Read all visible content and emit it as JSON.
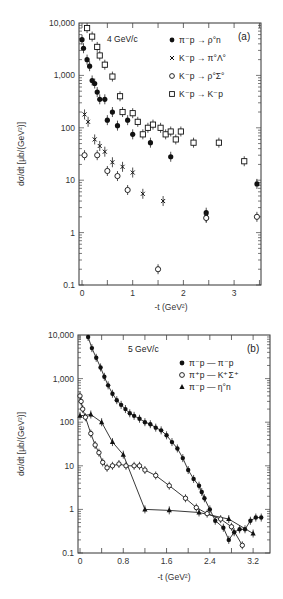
{
  "chart_data": [
    {
      "panel": "(a)",
      "type": "scatter",
      "title": "4 GeV/c",
      "xlabel": "-t (GeV²)",
      "ylabel": "dσ/dt [μb/(GeV²)]",
      "yscale": "log",
      "ylim": [
        0.1,
        10000
      ],
      "xlim": [
        0,
        3.5
      ],
      "xticks": [
        "0",
        "1",
        "2",
        "3"
      ],
      "yticks": [
        "10,000",
        "1,000",
        "100",
        "10",
        "1",
        "0.1"
      ],
      "legend_position": "upper right",
      "series": [
        {
          "name": "π⁻p → ρ°n",
          "marker": "filled-circle",
          "x": [
            0.0,
            0.03,
            0.1,
            0.15,
            0.2,
            0.25,
            0.3,
            0.35,
            0.45,
            0.5,
            0.6,
            0.7,
            0.9,
            1.0,
            1.35,
            1.75,
            2.45,
            3.45
          ],
          "y": [
            4800,
            3300,
            2000,
            1500,
            800,
            700,
            480,
            350,
            350,
            140,
            200,
            110,
            140,
            75,
            52,
            28,
            2.4,
            8.5
          ]
        },
        {
          "name": "K⁻p → π°Λ°",
          "marker": "cross",
          "x": [
            0.05,
            0.12,
            0.25,
            0.35,
            0.45,
            0.6,
            0.8,
            1.0,
            1.2,
            1.6,
            2.45
          ],
          "y": [
            180,
            130,
            60,
            45,
            35,
            22,
            18,
            14,
            5.5,
            4,
            2
          ]
        },
        {
          "name": "K⁻p → ρ°Σ°",
          "marker": "open-circle",
          "x": [
            0.05,
            0.3,
            0.5,
            0.7,
            0.9,
            1.5,
            2.45,
            3.45
          ],
          "y": [
            30,
            30,
            15,
            12,
            6.5,
            0.2,
            1.9,
            2
          ]
        },
        {
          "name": "K⁻p → K⁻p",
          "marker": "open-square",
          "x": [
            0.1,
            0.2,
            0.3,
            0.35,
            0.45,
            0.6,
            0.75,
            0.8,
            1.0,
            1.1,
            1.2,
            1.3,
            1.4,
            1.55,
            1.65,
            1.75,
            1.85,
            1.95,
            2.2,
            2.7,
            3.2
          ],
          "y": [
            8000,
            5500,
            3500,
            2400,
            1600,
            950,
            400,
            200,
            190,
            130,
            75,
            100,
            115,
            100,
            75,
            85,
            60,
            85,
            52,
            52,
            23,
            6.5,
            3.2
          ]
        }
      ]
    },
    {
      "panel": "(b)",
      "type": "scatter",
      "title": "5 GeV/c",
      "xlabel": "-t (GeV²)",
      "ylabel": "dσ/dt [μb/(GeV²)]",
      "yscale": "log",
      "ylim": [
        0.1,
        10000
      ],
      "xlim": [
        0,
        3.55
      ],
      "xticks": [
        "0",
        "0.8",
        "1.6",
        "2.4",
        "3.2"
      ],
      "yticks": [
        "10,000",
        "1,000",
        "100",
        "10",
        "1",
        "0.1"
      ],
      "legend_position": "upper right",
      "series": [
        {
          "name": "π⁻p → π⁻p",
          "marker": "filled-circle",
          "x": [
            0.15,
            0.22,
            0.3,
            0.38,
            0.45,
            0.52,
            0.6,
            0.68,
            0.76,
            0.84,
            0.92,
            1.0,
            1.1,
            1.2,
            1.3,
            1.4,
            1.5,
            1.6,
            1.7,
            1.8,
            1.9,
            2.0,
            2.1,
            2.2,
            2.25,
            2.3,
            2.4,
            2.5,
            2.65,
            2.75,
            2.85,
            2.95,
            3.05,
            3.15,
            3.25,
            3.35
          ],
          "y": [
            9000,
            5000,
            3000,
            1800,
            1100,
            700,
            450,
            320,
            250,
            200,
            160,
            140,
            120,
            100,
            90,
            75,
            65,
            50,
            35,
            25,
            15,
            8,
            5,
            3.5,
            2.5,
            1.8,
            1.0,
            0.55,
            0.38,
            0.2,
            0.3,
            0.35,
            0.35,
            0.55,
            0.65,
            0.65
          ]
        },
        {
          "name": "π⁺p → K⁺Σ⁺",
          "marker": "open-circle",
          "x": [
            0.0,
            0.02,
            0.05,
            0.1,
            0.2,
            0.28,
            0.35,
            0.42,
            0.5,
            0.6,
            0.72,
            0.85,
            1.0,
            1.1,
            1.2,
            1.4,
            1.65,
            1.95,
            2.15,
            2.35,
            2.6,
            2.8,
            3.0
          ],
          "y": [
            400,
            300,
            200,
            130,
            55,
            30,
            20,
            12,
            9,
            10,
            11,
            10,
            10,
            10,
            8,
            6,
            3.5,
            1.8,
            1.1,
            0.8,
            0.6,
            0.4,
            0.15
          ]
        },
        {
          "name": "π⁻p → η°n",
          "marker": "filled-triangle",
          "x": [
            0.0,
            0.2,
            0.4,
            0.6,
            0.8,
            1.2,
            1.65,
            2.2,
            2.75,
            3.2
          ],
          "y": [
            140,
            150,
            100,
            35,
            18,
            1.0,
            0.95,
            0.85,
            0.6,
            0.28
          ]
        }
      ]
    }
  ],
  "panels": {
    "a": {
      "label": "(a)",
      "energy": "4 GeV/c",
      "x_title": "-t (GeV²)",
      "y_title": "dσ/dt [μb/(GeV²)]",
      "legend": [
        {
          "symbol": "●",
          "text": "π⁻p → ρ°n"
        },
        {
          "symbol": "×",
          "text": "K⁻p → π°Λ°"
        },
        {
          "symbol": "○",
          "text": "K⁻p → ρ°Σ°"
        },
        {
          "symbol": "□",
          "text": "K⁻p → K⁻p"
        }
      ],
      "y_ticks": [
        "10,000",
        "1,000",
        "100",
        "10",
        "1",
        "0.1"
      ],
      "x_ticks": [
        "0",
        "1",
        "2",
        "3"
      ]
    },
    "b": {
      "label": "(b)",
      "energy": "5 GeV/c",
      "x_title": "-t (GeV²)",
      "y_title": "dσ/dt [μb/(GeV²)]",
      "legend": [
        {
          "symbol": "●",
          "text": "π⁻p — π⁻p"
        },
        {
          "symbol": "○",
          "text": "π⁺p — K⁺Σ⁺"
        },
        {
          "symbol": "▲",
          "text": "π⁻p — η°n"
        }
      ],
      "y_ticks": [
        "10,000",
        "1,000",
        "100",
        "10",
        "1",
        "0.1"
      ],
      "x_ticks": [
        "0",
        "0.8",
        "1.6",
        "2.4",
        "3.2"
      ]
    }
  }
}
